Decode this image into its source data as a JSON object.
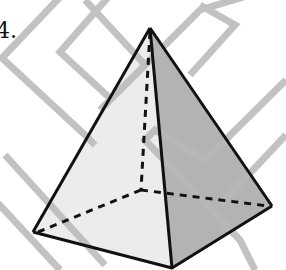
{
  "figure": {
    "problem_number": "4.",
    "colors": {
      "left_face": "#ececec",
      "right_face": "#b3b3b3",
      "edge": "#111111",
      "watermark": "#b8b8b8"
    }
  }
}
